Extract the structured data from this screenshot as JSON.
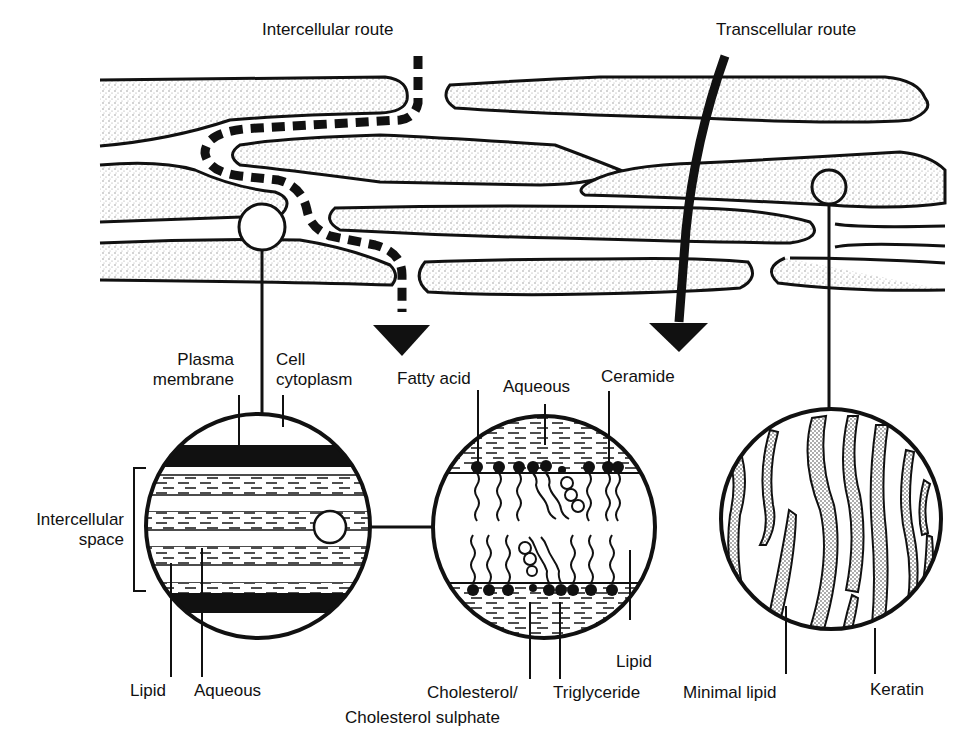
{
  "figure": {
    "colors": {
      "ink": "#111111",
      "background": "#ffffff",
      "stipple": "#9a9a9a"
    }
  },
  "routes": {
    "intercellular": {
      "label": "Intercellular route",
      "style": "dashed arrow"
    },
    "transcellular": {
      "label": "Transcellular route",
      "style": "solid arrow"
    }
  },
  "left_inset": {
    "labels": {
      "plasma_membrane_line1": "Plasma",
      "plasma_membrane_line2": "membrane",
      "cell_cytoplasm_line1": "Cell",
      "cell_cytoplasm_line2": "cytoplasm",
      "intercellular_space_line1": "Intercellular",
      "intercellular_space_line2": "space",
      "lipid": "Lipid",
      "aqueous": "Aqueous"
    }
  },
  "middle_inset": {
    "labels": {
      "fatty_acid": "Fatty acid",
      "aqueous": "Aqueous",
      "ceramide": "Ceramide",
      "lipid": "Lipid",
      "cholesterol_line1": "Cholesterol/",
      "cholesterol_line2": "Cholesterol sulphate",
      "triglyceride": "Triglyceride"
    }
  },
  "right_inset": {
    "labels": {
      "minimal_lipid": "Minimal lipid",
      "keratin": "Keratin"
    }
  }
}
